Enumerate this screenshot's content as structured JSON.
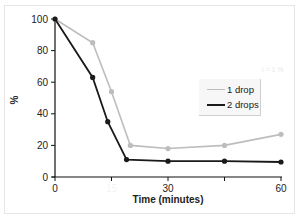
{
  "chart_data": {
    "type": "line",
    "title": "",
    "xlabel": "Time (minutes)",
    "ylabel": "%",
    "xlim": [
      0,
      60
    ],
    "ylim": [
      0,
      100
    ],
    "x_ticks": [
      0,
      15,
      30,
      45,
      60
    ],
    "x_tick_labels": [
      "0",
      "15",
      "30",
      "",
      "60"
    ],
    "y_ticks": [
      0,
      20,
      40,
      60,
      80,
      100
    ],
    "y_tick_labels": [
      "0",
      "20",
      "40",
      "60",
      "80",
      "100"
    ],
    "grid": false,
    "legend_position": "center-right",
    "series": [
      {
        "name": "1 drop",
        "color": "#bdbdbd",
        "x": [
          0,
          10,
          15,
          20,
          30,
          45,
          60
        ],
        "y": [
          100,
          85,
          54,
          20,
          18,
          20,
          27
        ]
      },
      {
        "name": "2 drops",
        "color": "#1a1a1a",
        "x": [
          0,
          10,
          14,
          19,
          30,
          45,
          60
        ],
        "y": [
          100,
          63,
          35,
          11,
          10,
          10,
          9.5
        ]
      }
    ]
  },
  "legend": {
    "items": [
      {
        "label": "1 drop",
        "color": "#bdbdbd"
      },
      {
        "label": "2 drops",
        "color": "#1a1a1a"
      }
    ]
  },
  "annotation_faint": "i = 1 %"
}
